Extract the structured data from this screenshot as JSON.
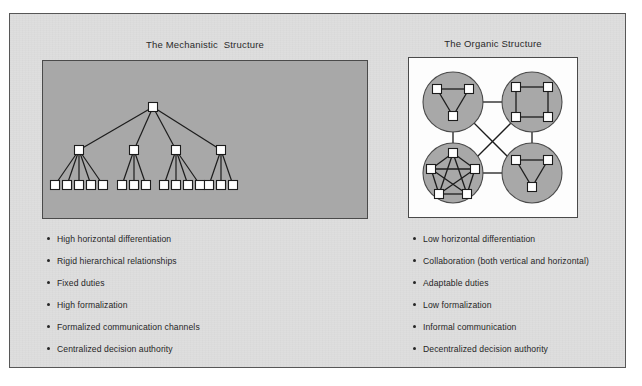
{
  "figure": {
    "background_color": "#ffffff",
    "page_color": "#dedede",
    "border_color": "#575757"
  },
  "panels": {
    "mechanistic": {
      "title": "The Mechanistic  Structure",
      "background_color": "#a8a8a8",
      "border_color": "#4a4a4a",
      "node_fill": "#ffffff",
      "node_stroke": "#1c1c1c",
      "link_color": "#1c1c1c",
      "diagram_type": "hierarchy-tree",
      "levels": 3,
      "root_count": 1,
      "middle_count": 4,
      "leaf_counts": [
        5,
        3,
        4,
        3
      ],
      "leaf_total": 15
    },
    "organic": {
      "title": "The Organic Structure",
      "background_color": "#fdfdfd",
      "border_color": "#4a4a4a",
      "circle_fill": "#a8a8a8",
      "circle_stroke": "#4a4a4a",
      "node_fill": "#ffffff",
      "node_stroke": "#1c1c1c",
      "link_color": "#1c1c1c",
      "diagram_type": "network-clusters",
      "cluster_count": 4,
      "clusters": [
        {
          "name": "top-left-triangle",
          "nodes": 3,
          "shape": "triangle",
          "fully_connected": true
        },
        {
          "name": "top-right-square",
          "nodes": 4,
          "shape": "square",
          "fully_connected": false
        },
        {
          "name": "bottom-left-pentagon",
          "nodes": 5,
          "shape": "pentagon",
          "fully_connected": true
        },
        {
          "name": "bottom-right-triangle",
          "nodes": 3,
          "shape": "triangle",
          "fully_connected": true
        }
      ],
      "inter_cluster_links": 6
    }
  },
  "mechanistic_list": {
    "items": [
      "High horizontal differentiation",
      "Rigid hierarchical relationships",
      "Fixed duties",
      "High formalization",
      "Formalized communication channels",
      "Centralized decision authority"
    ]
  },
  "organic_list": {
    "items": [
      "Low horizontal differentiation",
      "Collaboration (both vertical and horizontal)",
      "Adaptable duties",
      "Low formalization",
      "Informal communication",
      "Decentralized decision authority"
    ]
  }
}
